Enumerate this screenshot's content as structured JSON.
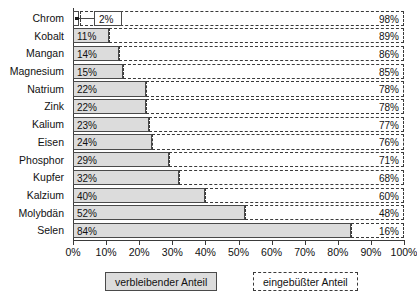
{
  "chart_data": {
    "type": "bar",
    "orientation": "horizontal",
    "stacked": true,
    "title": "",
    "xlabel": "",
    "ylabel": "",
    "xlim": [
      0,
      100
    ],
    "grid": false,
    "legend_position": "bottom",
    "categories": [
      "Chrom",
      "Kobalt",
      "Mangan",
      "Magnesium",
      "Natrium",
      "Zink",
      "Kalium",
      "Eisen",
      "Phosphor",
      "Kupfer",
      "Kalzium",
      "Molybdän",
      "Selen"
    ],
    "series": [
      {
        "name": "verbleibender Anteil",
        "values": [
          2,
          11,
          14,
          15,
          22,
          22,
          23,
          24,
          29,
          32,
          40,
          52,
          84
        ]
      },
      {
        "name": "eingebüßter Anteil",
        "values": [
          98,
          89,
          86,
          85,
          78,
          78,
          77,
          76,
          71,
          68,
          60,
          48,
          16
        ]
      }
    ],
    "remaining_labels": [
      "2%",
      "11%",
      "14%",
      "15%",
      "22%",
      "22%",
      "23%",
      "24%",
      "29%",
      "32%",
      "40%",
      "52%",
      "84%"
    ],
    "lost_labels": [
      "98%",
      "89%",
      "86%",
      "85%",
      "78%",
      "78%",
      "77%",
      "76%",
      "71%",
      "68%",
      "60%",
      "48%",
      "16%"
    ],
    "x_ticks": [
      0,
      10,
      20,
      30,
      40,
      50,
      60,
      70,
      80,
      90,
      100
    ],
    "x_tick_labels": [
      "0%",
      "10%",
      "20%",
      "30%",
      "40%",
      "50%",
      "60%",
      "70%",
      "80%",
      "90%",
      "100%"
    ],
    "colors": {
      "remaining_fill": "#dcdcdc",
      "remaining_border": "#4a4a4a",
      "lost_fill": "#ffffff",
      "lost_border": "#3a3a3a",
      "text": "#111111"
    }
  },
  "legend": {
    "remaining_label": "verbleibender Anteil",
    "lost_label": "eingebüßter Anteil"
  }
}
